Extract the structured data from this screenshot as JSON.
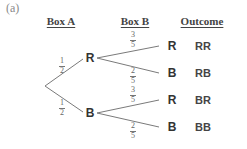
{
  "figure": {
    "panel_label": "(a)",
    "headers": {
      "box_a": "Box A",
      "box_b": "Box B",
      "outcome": "Outcome"
    },
    "tree": {
      "first_stage": [
        {
          "node": "R",
          "prob_num": "1",
          "prob_den": "2"
        },
        {
          "node": "B",
          "prob_num": "1",
          "prob_den": "2"
        }
      ],
      "second_stage": {
        "after_R": [
          {
            "node": "R",
            "prob_num": "3",
            "prob_den": "5",
            "outcome": "RR"
          },
          {
            "node": "B",
            "prob_num": "2",
            "prob_den": "5",
            "outcome": "RB"
          }
        ],
        "after_B": [
          {
            "node": "R",
            "prob_num": "3",
            "prob_den": "5",
            "outcome": "BR"
          },
          {
            "node": "B",
            "prob_num": "2",
            "prob_den": "5",
            "outcome": "BB"
          }
        ]
      }
    },
    "colors": {
      "line": "#777777",
      "text": "#333333"
    }
  }
}
